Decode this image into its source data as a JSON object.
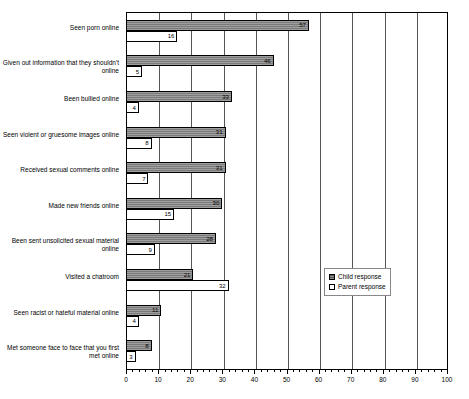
{
  "chart_data": {
    "type": "bar",
    "orientation": "horizontal",
    "title": "",
    "xlabel": "",
    "ylabel": "",
    "xlim": [
      0,
      100
    ],
    "xticks": [
      0,
      10,
      20,
      30,
      40,
      50,
      60,
      70,
      80,
      90,
      100
    ],
    "grid": true,
    "legend_position": "center-right",
    "categories": [
      "Seen porn online",
      "Given out information that they shouldn't online",
      "Been bullied online",
      "Seen violent or gruesome images online",
      "Received sexual comments online",
      "Made new friends online",
      "Been sent unsolicited sexual material online",
      "Visited a chatroom",
      "Seen racist or hateful material online",
      "Met someone face to face that you first met online"
    ],
    "series": [
      {
        "name": "Child response",
        "color": "#7a7a7a",
        "values": [
          57,
          46,
          33,
          31,
          31,
          30,
          28,
          21,
          11,
          8
        ]
      },
      {
        "name": "Parent response",
        "color": "#ffffff",
        "values": [
          16,
          5,
          4,
          8,
          7,
          15,
          9,
          32,
          4,
          3
        ]
      }
    ]
  },
  "legend": {
    "items": [
      {
        "label": "Child response",
        "swatch": "child"
      },
      {
        "label": "Parent response",
        "swatch": "parent"
      }
    ]
  }
}
